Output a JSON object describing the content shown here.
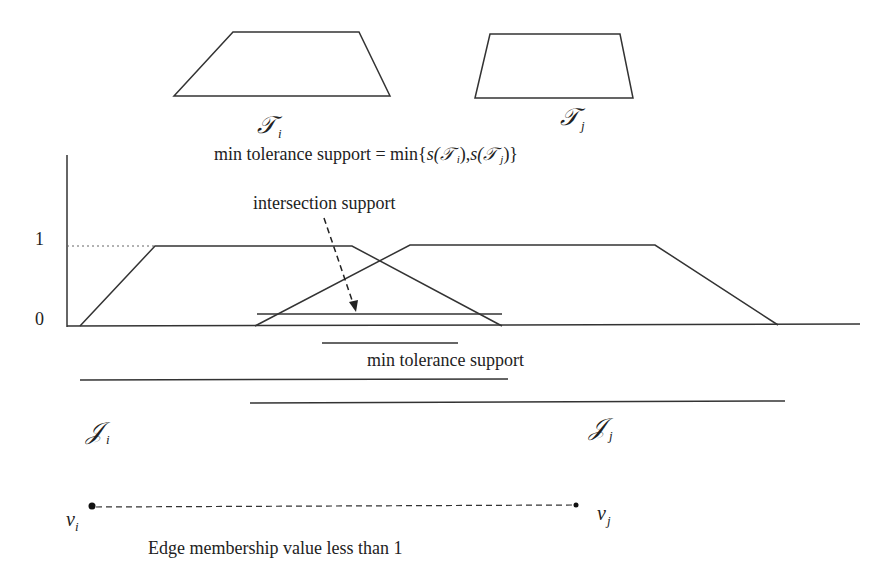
{
  "top_shapes": {
    "ti_label": "𝒯",
    "ti_sub": "i",
    "tj_label": "𝒯",
    "tj_sub": "j"
  },
  "formula": {
    "prefix": "min tolerance support = min{",
    "s1": "s(",
    "t1": "𝒯",
    "t1_sub": "i",
    "mid": "),",
    "s2": "s(",
    "t2": "𝒯",
    "t2_sub": "j",
    "suffix": ")}"
  },
  "axis": {
    "y_tick_1": "1",
    "y_tick_0": "0"
  },
  "annotations": {
    "intersection_support": "intersection support",
    "min_tolerance_support": "min tolerance support"
  },
  "supports": {
    "ii_label": "𝒥",
    "ii_sub": "i",
    "ij_label": "𝒥",
    "ij_sub": "j"
  },
  "edge": {
    "vi_label": "v",
    "vi_sub": "i",
    "vj_label": "v",
    "vj_sub": "j",
    "caption": "Edge membership value less than 1"
  },
  "colors": {
    "stroke": "#333333",
    "text": "#222222"
  }
}
